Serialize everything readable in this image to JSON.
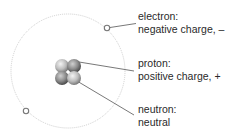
{
  "diagram": {
    "orbit": {
      "cx": 68,
      "cy": 71,
      "r": 57,
      "color": "#c8c8c8"
    },
    "electrons": [
      {
        "cx": 107,
        "cy": 28,
        "r": 3
      },
      {
        "cx": 26,
        "cy": 111,
        "r": 3
      }
    ],
    "nucleus": {
      "cx": 68,
      "cy": 73,
      "particles": 4
    },
    "labels": [
      {
        "id": "electron",
        "name": "electron:",
        "description": "negative charge, –",
        "top": 10
      },
      {
        "id": "proton",
        "name": "proton:",
        "description": "positive charge, +",
        "top": 57
      },
      {
        "id": "neutron",
        "name": "neutron:",
        "description": "neutral",
        "top": 103
      }
    ],
    "leader_line_color": "#555555"
  }
}
